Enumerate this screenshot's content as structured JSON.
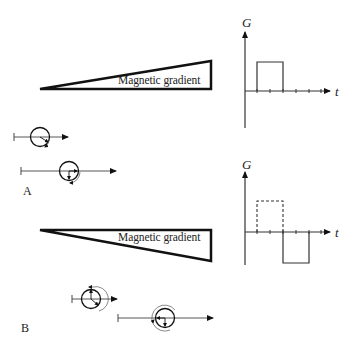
{
  "panel_a": {
    "label": "A",
    "gradient_label": "Magnetic gradient",
    "graph": {
      "y_axis_label": "G",
      "x_axis_label": "t",
      "pulse": "positive gradient lobe, solid"
    }
  },
  "panel_b": {
    "label": "B",
    "gradient_label": "Magnetic gradient",
    "graph": {
      "y_axis_label": "G",
      "x_axis_label": "t",
      "pulse": "dashed positive lobe followed by solid negative lobe"
    }
  }
}
